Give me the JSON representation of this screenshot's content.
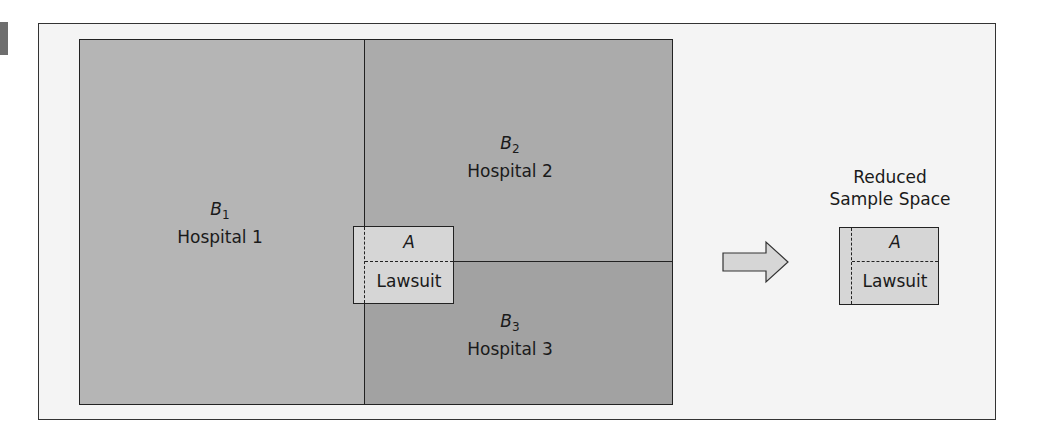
{
  "figure": {
    "regions": [
      {
        "symbol": "B",
        "subscript": "1",
        "name": "Hospital 1"
      },
      {
        "symbol": "B",
        "subscript": "2",
        "name": "Hospital 2"
      },
      {
        "symbol": "B",
        "subscript": "3",
        "name": "Hospital 3"
      }
    ],
    "event": {
      "symbol": "A",
      "name": "Lawsuit"
    },
    "reduced": {
      "title_line1": "Reduced",
      "title_line2": "Sample Space",
      "symbol": "A",
      "name": "Lawsuit"
    },
    "colors": {
      "b1": "#b5b5b5",
      "b2": "#ababab",
      "b3": "#a2a2a2",
      "event": "#d6d6d6",
      "background": "#f4f4f4"
    }
  }
}
